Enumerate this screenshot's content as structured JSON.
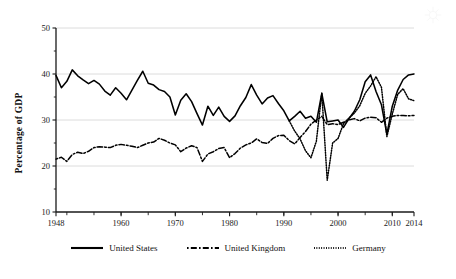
{
  "chart_data": {
    "type": "line",
    "title": "",
    "xlabel": "",
    "ylabel": "Percentage of GDP",
    "xlim": [
      1948,
      2014
    ],
    "ylim": [
      10,
      50
    ],
    "yticks": [
      10,
      20,
      30,
      40,
      50
    ],
    "xticks": [
      1948,
      1960,
      1970,
      1980,
      1990,
      2000,
      2010,
      2014
    ],
    "xminor_step": 5,
    "grid": "horizontal",
    "legend_position": "bottom",
    "series": [
      {
        "name": "United States",
        "style": "solid",
        "color": "#000000",
        "x": [
          1948,
          1949,
          1950,
          1951,
          1952,
          1953,
          1954,
          1955,
          1956,
          1957,
          1958,
          1959,
          1960,
          1961,
          1962,
          1963,
          1964,
          1965,
          1966,
          1967,
          1968,
          1969,
          1970,
          1971,
          1972,
          1973,
          1974,
          1975,
          1976,
          1977,
          1978,
          1979,
          1980,
          1981,
          1982,
          1983,
          1984,
          1985,
          1986,
          1987,
          1988,
          1989,
          1990,
          1991,
          1992,
          1993,
          1994,
          1995,
          1996,
          1997,
          1998,
          1999,
          2000,
          2001,
          2002,
          2003,
          2004,
          2005,
          2006,
          2007,
          2008,
          2009,
          2010,
          2011,
          2012,
          2013,
          2014
        ],
        "values": [
          39.7,
          37.0,
          38.4,
          40.9,
          39.6,
          38.7,
          37.9,
          38.6,
          37.8,
          36.3,
          35.4,
          37.0,
          35.8,
          34.4,
          36.5,
          38.6,
          40.6,
          38.0,
          37.6,
          36.6,
          36.2,
          35.0,
          31.1,
          34.3,
          35.7,
          34.0,
          31.4,
          28.9,
          33.0,
          31.0,
          32.8,
          30.8,
          29.7,
          30.9,
          33.1,
          34.9,
          37.7,
          35.4,
          33.5,
          34.8,
          35.3,
          33.6,
          32.0,
          29.8,
          30.8,
          31.9,
          30.4,
          30.8,
          29.5,
          35.8,
          29.6,
          29.8,
          30.0,
          28.4,
          30.3,
          31.9,
          34.4,
          38.3,
          39.8,
          36.2,
          33.3,
          26.9,
          33.0,
          36.5,
          38.8,
          39.8,
          40.0
        ]
      },
      {
        "name": "United Kingdom",
        "style": "dashdot",
        "color": "#000000",
        "x": [
          1948,
          1949,
          1950,
          1951,
          1952,
          1953,
          1954,
          1955,
          1956,
          1957,
          1958,
          1959,
          1960,
          1961,
          1962,
          1963,
          1964,
          1965,
          1966,
          1967,
          1968,
          1969,
          1970,
          1971,
          1972,
          1973,
          1974,
          1975,
          1976,
          1977,
          1978,
          1979,
          1980,
          1981,
          1982,
          1983,
          1984,
          1985,
          1986,
          1987,
          1988,
          1989,
          1990,
          1991,
          1992,
          1993,
          1994,
          1995,
          1996,
          1997,
          1998,
          1999,
          2000,
          2001,
          2002,
          2003,
          2004,
          2005,
          2006,
          2007,
          2008,
          2009,
          2010,
          2011,
          2012,
          2013,
          2014
        ],
        "values": [
          21.5,
          21.9,
          21.0,
          22.5,
          23.0,
          22.7,
          23.2,
          24.0,
          24.2,
          24.1,
          24.0,
          24.5,
          24.7,
          24.5,
          24.3,
          24.0,
          24.5,
          25.0,
          25.2,
          26.0,
          25.6,
          25.0,
          24.6,
          23.1,
          23.9,
          24.4,
          24.0,
          21.0,
          22.6,
          23.1,
          23.8,
          24.0,
          21.8,
          22.7,
          23.9,
          24.6,
          25.0,
          25.9,
          25.1,
          24.9,
          26.0,
          26.6,
          26.7,
          25.5,
          24.8,
          26.2,
          27.5,
          29.1,
          30.0,
          30.8,
          29.0,
          29.2,
          29.0,
          29.5,
          30.0,
          30.3,
          29.8,
          30.4,
          30.6,
          30.5,
          29.5,
          30.4,
          30.8,
          31.0,
          31.0,
          30.9,
          31.0
        ]
      },
      {
        "name": "Germany",
        "style": "dotted",
        "color": "#000000",
        "x": [
          1991,
          1992,
          1993,
          1994,
          1995,
          1996,
          1997,
          1998,
          1999,
          2000,
          2001,
          2002,
          2003,
          2004,
          2005,
          2006,
          2007,
          2008,
          2009,
          2010,
          2011,
          2012,
          2013,
          2014
        ],
        "values": [
          29.8,
          27.6,
          25.9,
          23.3,
          21.8,
          25.4,
          35.8,
          16.9,
          25.0,
          26.0,
          29.2,
          30.4,
          31.5,
          33.1,
          35.8,
          37.4,
          39.4,
          37.1,
          26.4,
          31.3,
          35.6,
          36.8,
          34.6,
          34.2
        ]
      }
    ]
  },
  "legend": {
    "items": [
      {
        "label": "United States",
        "style": "solid"
      },
      {
        "label": "United Kingdom",
        "style": "dashdot"
      },
      {
        "label": "Germany",
        "style": "dotted"
      }
    ]
  },
  "axes": {
    "y_title": "Percentage of GDP"
  }
}
